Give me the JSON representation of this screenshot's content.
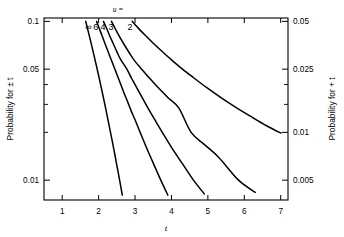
{
  "chart_data": {
    "type": "line",
    "title": "",
    "xlabel": "t",
    "ylabel_left": "Probability for ± t",
    "ylabel_right": "Probability for + t",
    "param_label": "u =",
    "xlim": [
      0.5,
      7.2
    ],
    "ylim_left": [
      0.0075,
      0.105
    ],
    "ylim_right": [
      0.00375,
      0.0525
    ],
    "yscale": "log",
    "grid": false,
    "legend_position": "top-inline-curve-labels",
    "xticks": [
      1,
      2,
      3,
      4,
      5,
      6,
      7
    ],
    "xtick_labels": [
      "1",
      "2",
      "3",
      "4",
      "5",
      "6",
      "7"
    ],
    "yticks_left_major": [
      0.1,
      0.05,
      0.01
    ],
    "ytick_labels_left": [
      "0.1",
      "0.05",
      "0.01"
    ],
    "yticks_left_minor": [
      0.04,
      0.03,
      0.02
    ],
    "yticks_right_major": [
      0.05,
      0.025,
      0.01,
      0.005
    ],
    "ytick_labels_right": [
      "0.05",
      "0.025",
      "0.01",
      "0.005"
    ],
    "yticks_right_minor": [
      0.02,
      0.015
    ],
    "series": [
      {
        "name": "∞",
        "label": "∞",
        "label_x": 1.72,
        "points": [
          [
            1.645,
            0.1
          ],
          [
            1.7,
            0.0892
          ],
          [
            1.75,
            0.0801
          ],
          [
            1.8,
            0.0719
          ],
          [
            1.85,
            0.0643
          ],
          [
            1.9,
            0.0574
          ],
          [
            1.96,
            0.05
          ],
          [
            2.0,
            0.0455
          ],
          [
            2.05,
            0.0404
          ],
          [
            2.1,
            0.0357
          ],
          [
            2.15,
            0.0316
          ],
          [
            2.2,
            0.0278
          ],
          [
            2.25,
            0.0244
          ],
          [
            2.3,
            0.0214
          ],
          [
            2.35,
            0.0188
          ],
          [
            2.4,
            0.0164
          ],
          [
            2.45,
            0.0143
          ],
          [
            2.5,
            0.0124
          ],
          [
            2.55,
            0.0108
          ],
          [
            2.58,
            0.0099
          ],
          [
            2.65,
            0.00805
          ],
          [
            2.7,
            0.00693
          ],
          [
            2.8,
            0.00511
          ],
          [
            2.9,
            0.00373
          ],
          [
            2.97,
            0.00298
          ]
        ]
      },
      {
        "name": "6",
        "label": "6",
        "label_x": 1.92,
        "points": [
          [
            1.943,
            0.1
          ],
          [
            2.0,
            0.0924
          ],
          [
            2.1,
            0.0805
          ],
          [
            2.2,
            0.07
          ],
          [
            2.3,
            0.061
          ],
          [
            2.447,
            0.05
          ],
          [
            2.5,
            0.0465
          ],
          [
            2.6,
            0.0405
          ],
          [
            2.7,
            0.0353
          ],
          [
            2.8,
            0.031
          ],
          [
            2.9,
            0.0271
          ],
          [
            3.0,
            0.024
          ],
          [
            3.14,
            0.02
          ],
          [
            3.3,
            0.0163
          ],
          [
            3.5,
            0.0128
          ],
          [
            3.707,
            0.01
          ],
          [
            3.9,
            0.00805
          ],
          [
            4.1,
            0.0065
          ],
          [
            4.3,
            0.0053
          ],
          [
            4.5,
            0.00435
          ],
          [
            4.58,
            0.004
          ]
        ]
      },
      {
        "name": "4",
        "label": "4",
        "label_x": 2.12,
        "points": [
          [
            2.132,
            0.1
          ],
          [
            2.2,
            0.0925
          ],
          [
            2.3,
            0.0815
          ],
          [
            2.4,
            0.0725
          ],
          [
            2.5,
            0.0645
          ],
          [
            2.6,
            0.0578
          ],
          [
            2.776,
            0.05
          ],
          [
            2.9,
            0.044
          ],
          [
            3.0,
            0.04
          ],
          [
            3.2,
            0.033
          ],
          [
            3.4,
            0.0273
          ],
          [
            3.6,
            0.0228
          ],
          [
            3.747,
            0.02
          ],
          [
            4.0,
            0.0161
          ],
          [
            4.3,
            0.0127
          ],
          [
            4.604,
            0.01
          ],
          [
            4.9,
            0.0082
          ],
          [
            5.2,
            0.0068
          ],
          [
            5.5,
            0.0057
          ],
          [
            5.8,
            0.0048
          ],
          [
            6.05,
            0.00425
          ]
        ]
      },
      {
        "name": "3",
        "label": "3",
        "label_x": 2.34,
        "points": [
          [
            2.353,
            0.1
          ],
          [
            2.45,
            0.0905
          ],
          [
            2.55,
            0.082
          ],
          [
            2.7,
            0.0715
          ],
          [
            2.85,
            0.063
          ],
          [
            3.0,
            0.056
          ],
          [
            3.182,
            0.05
          ],
          [
            3.4,
            0.0438
          ],
          [
            3.6,
            0.039
          ],
          [
            3.9,
            0.0332
          ],
          [
            4.2,
            0.0285
          ],
          [
            4.541,
            0.02
          ],
          [
            4.9,
            0.0168
          ],
          [
            5.3,
            0.0139
          ],
          [
            5.841,
            0.01
          ],
          [
            6.3,
            0.00838
          ],
          [
            6.7,
            0.00725
          ],
          [
            7.0,
            0.00655
          ]
        ]
      },
      {
        "name": "2",
        "label": "2",
        "label_x": 2.86,
        "points": [
          [
            2.92,
            0.1
          ],
          [
            3.1,
            0.09
          ],
          [
            3.3,
            0.0808
          ],
          [
            3.5,
            0.0728
          ],
          [
            3.7,
            0.066
          ],
          [
            4.0,
            0.0572
          ],
          [
            4.303,
            0.05
          ],
          [
            4.6,
            0.0443
          ],
          [
            5.0,
            0.0378
          ],
          [
            5.4,
            0.0326
          ],
          [
            5.8,
            0.0284
          ],
          [
            6.2,
            0.025
          ],
          [
            6.6,
            0.0221
          ],
          [
            6.965,
            0.02
          ],
          [
            7.0,
            0.0199
          ]
        ]
      }
    ]
  }
}
